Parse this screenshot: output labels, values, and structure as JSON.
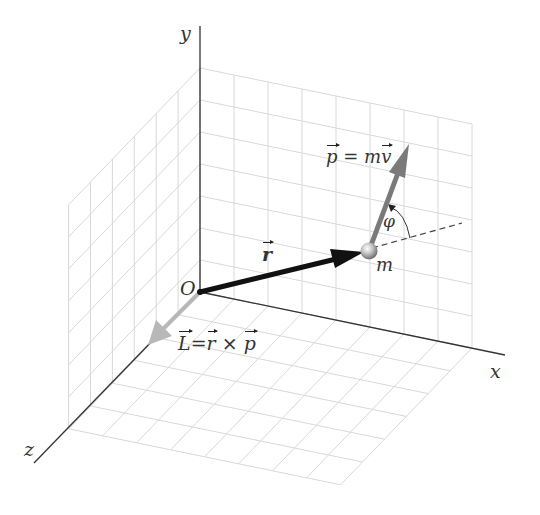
{
  "figure": {
    "type": "3d-vector-diagram"
  },
  "axes": {
    "x_label": "x",
    "y_label": "y",
    "z_label": "z",
    "origin_label": "O"
  },
  "grid": {
    "back_wall_xy": {
      "cols": 8,
      "rows": 7
    },
    "side_wall_yz": {
      "cols": 6,
      "rows": 7
    },
    "floor_xz": {
      "cols": 8,
      "rows": 6
    },
    "line_color": "#d8d8d8"
  },
  "vectors": {
    "position": {
      "symbol": "r",
      "color": "#111111"
    },
    "momentum": {
      "lhs": "p",
      "eq": "=",
      "rhs_scalar": "m",
      "rhs_vec": "v",
      "color": "#7a7a7a"
    },
    "angular_momentum": {
      "lhs": "L",
      "eq": "=",
      "a": "r",
      "op": "×",
      "b": "p",
      "color": "#b8b8b8"
    }
  },
  "particle": {
    "label": "m"
  },
  "angle": {
    "label": "φ"
  }
}
